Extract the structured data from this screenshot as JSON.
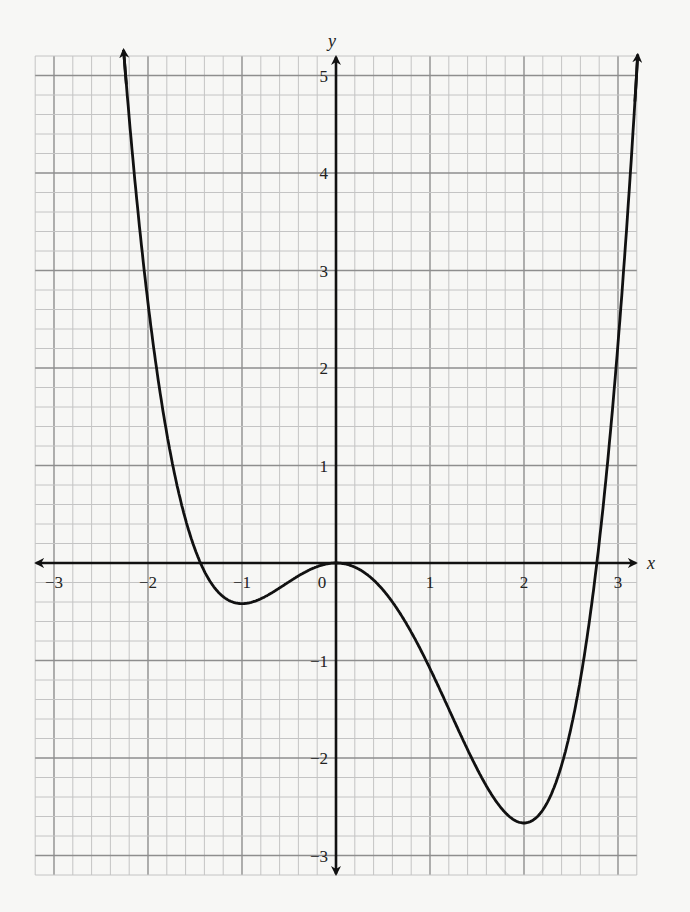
{
  "chart_data": {
    "type": "line",
    "title": "",
    "xlabel": "x",
    "ylabel": "y",
    "xlim": [
      -3.2,
      3.2
    ],
    "ylim": [
      -3.2,
      5.2
    ],
    "grid": true,
    "grid_major_step": 1,
    "grid_minor_step": 0.2,
    "legend": null,
    "x_ticks": [
      -3,
      -2,
      -1,
      0,
      1,
      2,
      3
    ],
    "x_tick_labels": [
      "−3",
      "−2",
      "−1",
      "0",
      "1",
      "2",
      "3"
    ],
    "y_ticks": [
      -3,
      -2,
      -1,
      1,
      2,
      3,
      4,
      5
    ],
    "y_tick_labels": [
      "−3",
      "−2",
      "−1",
      "1",
      "2",
      "3",
      "4",
      "5"
    ],
    "series": [
      {
        "name": "f(x)",
        "description": "quartic curve with local minima at x=-1 and x=2, local maximum at x=0; arrows at both ends",
        "fitted_function": "x^4/4 - x^3/3 - x^2",
        "x": [
          -2.26,
          -2.2,
          -2.0,
          -1.8,
          -1.6,
          -1.44,
          -1.2,
          -1.0,
          -0.8,
          -0.6,
          -0.4,
          -0.2,
          0.0,
          0.2,
          0.4,
          0.6,
          0.8,
          1.0,
          1.2,
          1.4,
          1.6,
          1.8,
          2.0,
          2.2,
          2.4,
          2.6,
          2.78,
          3.0,
          3.21
        ],
        "y": [
          5.26,
          4.5,
          2.67,
          1.33,
          0.42,
          0.0,
          -0.34,
          -0.42,
          -0.37,
          -0.25,
          -0.13,
          -0.04,
          0.0,
          -0.04,
          -0.17,
          -0.4,
          -0.71,
          -1.08,
          -1.5,
          -1.92,
          -2.3,
          -2.58,
          -2.67,
          -2.48,
          -1.84,
          -0.66,
          0.0,
          2.25,
          5.1
        ]
      }
    ],
    "key_points": {
      "local_min_left": [
        -1,
        -0.42
      ],
      "local_max": [
        0,
        0
      ],
      "local_min_right": [
        2,
        -2.67
      ],
      "x_intercepts": [
        -1.44,
        0,
        2.78
      ]
    }
  },
  "axes": {
    "x_label": "x",
    "y_label": "y"
  },
  "layout": {
    "origin_px": [
      336,
      563
    ],
    "px_per_unit_x": 94,
    "px_per_unit_y": 97.5,
    "colors": {
      "grid_minor": "#c4c4c4",
      "grid_major": "#8e8e8e",
      "curve": "#111111",
      "axis": "#111111"
    }
  }
}
